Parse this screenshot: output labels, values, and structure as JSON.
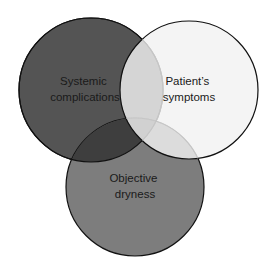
{
  "diagram": {
    "type": "venn",
    "sets": [
      {
        "id": "systemic",
        "label_lines": [
          "Systemic",
          "complications"
        ],
        "fill": "#545454",
        "cx": 91,
        "cy": 90,
        "r": 72
      },
      {
        "id": "dryness",
        "label_lines": [
          "Objective",
          "dryness"
        ],
        "fill": "#7d7d7d",
        "cx": 135,
        "cy": 187,
        "r": 69
      },
      {
        "id": "symptoms",
        "label_lines": [
          "Patient’s",
          "symptoms"
        ],
        "fill": "#f2f2f2",
        "cx": 189,
        "cy": 90,
        "r": 69
      }
    ],
    "stroke_color": "#111111",
    "overlap_colors": {
      "systemic_dryness": "#3e3e3e",
      "systemic_symptoms": "#cfcfcf",
      "dryness_symptoms": "#dadada"
    }
  }
}
